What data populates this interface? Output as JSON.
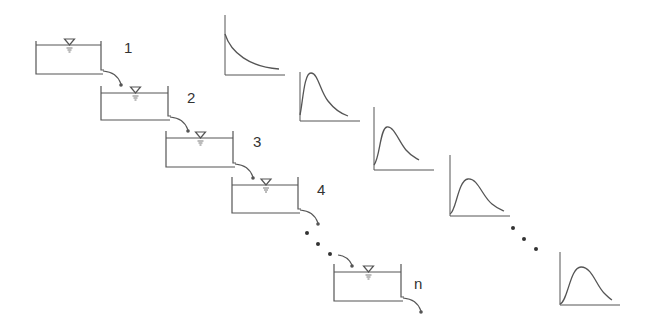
{
  "diagram": {
    "title": "",
    "colors": {
      "line": "#555555",
      "text": "#333333",
      "background": "#ffffff"
    },
    "reservoirs": [
      {
        "label": "1",
        "x": 36,
        "y": 41,
        "w": 65,
        "h": 33,
        "water_y": 45
      },
      {
        "label": "2",
        "x": 101,
        "y": 86,
        "w": 67,
        "h": 34,
        "water_y": 93
      },
      {
        "label": "3",
        "x": 166,
        "y": 131,
        "w": 67,
        "h": 36,
        "water_y": 138
      },
      {
        "label": "4",
        "x": 232,
        "y": 177,
        "w": 66,
        "h": 36,
        "water_y": 185
      },
      {
        "label": "n",
        "x": 334,
        "y": 264,
        "w": 67,
        "h": 37,
        "water_y": 272
      }
    ],
    "labels": [
      {
        "text": "1",
        "x": 124,
        "y": 48
      },
      {
        "text": "2",
        "x": 187,
        "y": 98
      },
      {
        "text": "3",
        "x": 253,
        "y": 142
      },
      {
        "text": "4",
        "x": 317,
        "y": 190
      },
      {
        "text": "n",
        "x": 414,
        "y": 282
      }
    ],
    "ellipsis_reservoirs": [
      [
        307,
        233
      ],
      [
        318,
        244
      ],
      [
        330,
        254
      ]
    ],
    "ellipsis_charts": [
      [
        513,
        228
      ],
      [
        524,
        239
      ],
      [
        536,
        249
      ]
    ],
    "hydrographs": [
      {
        "name": "after-reservoir-1",
        "x0": 225,
        "y0": 75,
        "w": 60,
        "h": 60,
        "shape": "exponential-decay"
      },
      {
        "name": "after-reservoir-2",
        "x0": 300,
        "y0": 121,
        "w": 60,
        "h": 49,
        "shape": "sharp-peak"
      },
      {
        "name": "after-reservoir-3",
        "x0": 374,
        "y0": 170,
        "w": 60,
        "h": 63,
        "shape": "peak"
      },
      {
        "name": "after-reservoir-4",
        "x0": 450,
        "y0": 216,
        "w": 60,
        "h": 61,
        "shape": "broad-peak"
      },
      {
        "name": "after-reservoir-n",
        "x0": 560,
        "y0": 305,
        "w": 60,
        "h": 53,
        "shape": "broadest-peak"
      }
    ]
  }
}
